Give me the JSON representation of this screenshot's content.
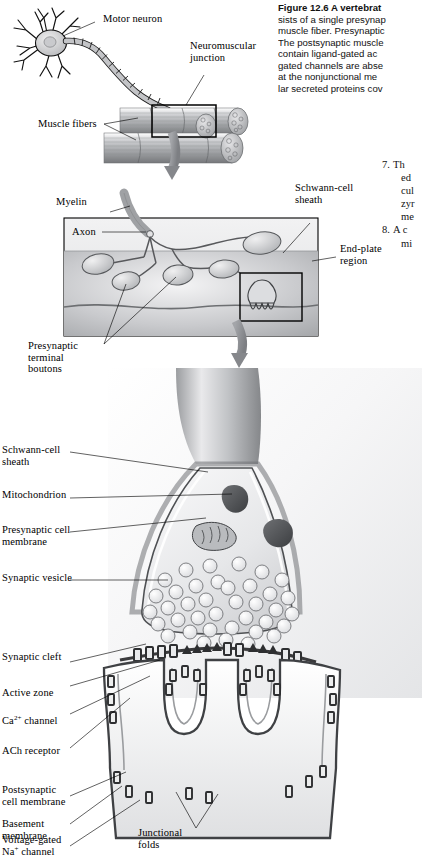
{
  "figure": {
    "number": "Figure 12.6",
    "caption_lines": [
      "Figure 12.6  A vertebrat",
      "sists of a single presynap",
      "muscle fiber. Presynaptic",
      "The postsynaptic muscle",
      "contain ligand-gated ac",
      "gated channels are abse",
      "at the nonjunctional me",
      "lar secreted proteins cov"
    ],
    "caption_bold_prefix": "Figure 12.6  A vertebrat",
    "numbered_list": [
      {
        "number": "7.",
        "lines": [
          "Th",
          "ed",
          "cul",
          "zyr",
          "me"
        ]
      },
      {
        "number": "8.",
        "lines": [
          "A c",
          "mi"
        ]
      }
    ]
  },
  "panels": {
    "top": {
      "name": "motor-neuron-overview",
      "labels": [
        {
          "id": "motor-neuron",
          "text": "Motor neuron"
        },
        {
          "id": "neuromuscular-junction",
          "text": "Neuromuscular\njunction"
        },
        {
          "id": "muscle-fibers",
          "text": "Muscle fibers"
        }
      ]
    },
    "middle": {
      "name": "end-plate-region",
      "labels": [
        {
          "id": "myelin",
          "text": "Myelin"
        },
        {
          "id": "axon",
          "text": "Axon"
        },
        {
          "id": "schwann-cell-sheath",
          "text": "Schwann-cell\nsheath"
        },
        {
          "id": "end-plate-region",
          "text": "End-plate\nregion"
        },
        {
          "id": "presynaptic-terminal-boutons",
          "text": "Presynaptic\nterminal\nboutons"
        }
      ]
    },
    "bottom": {
      "name": "synaptic-bouton-ultrastructure",
      "labels_left": [
        {
          "id": "schwann-cell-sheath",
          "text": "Schwann-cell\nsheath"
        },
        {
          "id": "mitochondrion",
          "text": "Mitochondrion"
        },
        {
          "id": "presynaptic-cell-membrane",
          "text": "Presynaptic cell\nmembrane"
        },
        {
          "id": "synaptic-vesicle",
          "text": "Synaptic vesicle"
        },
        {
          "id": "synaptic-cleft",
          "text": "Synaptic cleft"
        },
        {
          "id": "active-zone",
          "text": "Active zone"
        },
        {
          "id": "ca-channel",
          "text": "Ca2+ channel",
          "html": "Ca<sup>2+</sup> channel"
        },
        {
          "id": "ach-receptor",
          "text": "ACh receptor"
        },
        {
          "id": "postsynaptic-cell-membrane",
          "text": "Postsynaptic\ncell membrane"
        },
        {
          "id": "basement-membrane",
          "text": "Basement\nmembrane"
        },
        {
          "id": "voltage-gated-na-channel",
          "text": "Voltage-gated Na+ channel",
          "html": "Voltage-gated<br>Na<sup>+</sup> channel"
        }
      ],
      "labels_inner": [
        {
          "id": "junctional-folds",
          "text": "Junctional\nfolds"
        }
      ]
    }
  },
  "colors": {
    "ink": "#000000",
    "paper": "#ffffff",
    "arrow_gray": "#8e9196",
    "panel_tint": "#d9dadd",
    "membrane_dark": "#3a3a3c",
    "cytoplasm": "#e8e9ec",
    "muscle_gray": "#b9bbbe"
  }
}
